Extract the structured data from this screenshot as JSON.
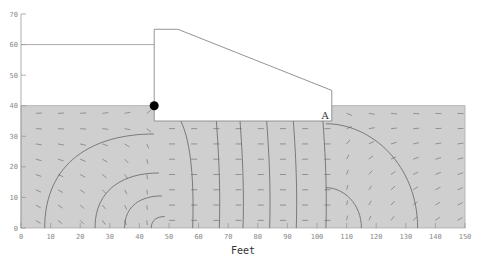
{
  "chart_data": {
    "type": "diagram",
    "xlabel": "Feet",
    "ylabel": "",
    "xlim": [
      0,
      150
    ],
    "ylim": [
      0,
      70
    ],
    "x_ticks": [
      0,
      10,
      20,
      30,
      40,
      50,
      60,
      70,
      80,
      90,
      100,
      110,
      120,
      130,
      140,
      150
    ],
    "y_ticks": [
      0,
      10,
      20,
      30,
      40,
      50,
      60,
      70
    ],
    "soil_region": {
      "x": [
        0,
        150
      ],
      "y": [
        0,
        40
      ],
      "fill": "#cfcfcf"
    },
    "headwater_level": 60,
    "dam_profile": [
      [
        45,
        35
      ],
      [
        45,
        65
      ],
      [
        53,
        65
      ],
      [
        105,
        45
      ],
      [
        105,
        35
      ]
    ],
    "marker_point": {
      "x": 45,
      "y": 40
    },
    "label_point": {
      "text": "A",
      "x": 103,
      "y": 37
    },
    "equipotential_lines_base_x": [
      8,
      25,
      35,
      44,
      58,
      67,
      75,
      84,
      93,
      103,
      115,
      134
    ]
  },
  "axis": {
    "xlabel": "Feet"
  },
  "point_label": "A"
}
